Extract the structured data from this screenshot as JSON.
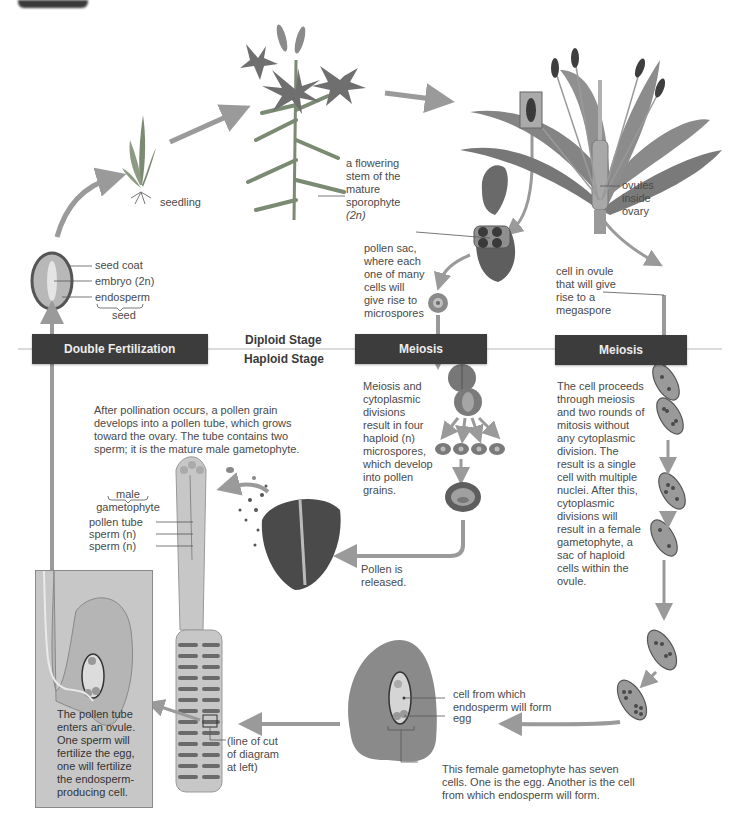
{
  "figure": {
    "colors": {
      "stage_bar": "#3c3c3c",
      "arrow": "#9a9a9a",
      "inset_bg": "#c7c7c7",
      "text": "#4a4a4a"
    }
  },
  "stage_bars": {
    "double_fertilization": "Double Fertilization",
    "meiosis_male": "Meiosis",
    "meiosis_female": "Meiosis",
    "diploid": "Diploid Stage",
    "haploid": "Haploid Stage"
  },
  "labels": {
    "seedling": "seedling",
    "sporophyte": [
      "a flowering",
      "stem of the",
      "mature",
      "sporophyte",
      "(2n)"
    ],
    "ovules": [
      "ovules",
      "inside",
      "ovary"
    ],
    "pollen_sac": [
      "pollen sac,",
      "where each",
      "one of many",
      "cells will",
      "give rise to",
      "microspores"
    ],
    "cell_in_ovule": [
      "cell in ovule",
      "that will give",
      "rise to a",
      "megaspore"
    ],
    "seed": {
      "seed_coat": "seed coat",
      "embryo": "embryo (2n)",
      "endosperm": "endosperm",
      "seed": "seed"
    },
    "male_meiosis_desc": [
      "Meiosis and",
      "cytoplasmic",
      "divisions",
      "result in four",
      "haploid (n)",
      "microspores,",
      "which develop",
      "into pollen",
      "grains."
    ],
    "female_meiosis_desc": [
      "The cell proceeds",
      "through meiosis",
      "and two rounds of",
      "mitosis without",
      "any cytoplasmic",
      "division. The",
      "result is a single",
      "cell with multiple",
      "nuclei. After this,",
      "cytoplasmic",
      "divisions will",
      "result in a female",
      "gametophyte, a",
      "sac of haploid",
      "cells within the",
      "ovule."
    ],
    "pollination_desc": [
      "After pollination occurs, a pollen grain",
      "develops into a pollen tube, which grows",
      "toward the ovary. The tube contains two",
      "sperm; it is the mature male gametophyte."
    ],
    "male_gametophyte": {
      "title": [
        "male",
        "gametophyte"
      ],
      "pollen_tube": "pollen tube",
      "sperm1": "sperm (n)",
      "sperm2": "sperm (n)"
    },
    "pollen_released": [
      "Pollen is",
      "released."
    ],
    "inset_desc": [
      "The pollen tube",
      "enters an ovule.",
      "One sperm will",
      "fertilize the egg,",
      "one will fertilize",
      "the endosperm-",
      "producing cell."
    ],
    "line_of_cut": [
      "(line of cut",
      "of diagram",
      "at left)"
    ],
    "endosperm_cell": [
      "cell from which",
      "endosperm will form"
    ],
    "egg": "egg",
    "female_gametophyte_desc": [
      "This female gametophyte has seven",
      "cells. One is the egg. Another is the cell",
      "from which endosperm will form."
    ]
  }
}
